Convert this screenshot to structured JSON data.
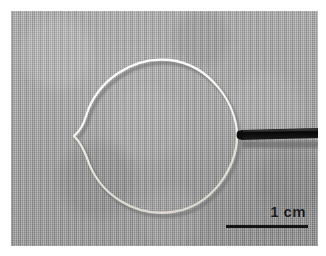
{
  "figure": {
    "kind": "laboratory-photograph",
    "plate_border_color": "#ffffff",
    "background": {
      "material": "woven fabric cloth",
      "color": "#a8a8a8",
      "texture": "fine plain-weave cross hatch"
    }
  },
  "specimen": {
    "wire_loop": {
      "label": "wire-loop",
      "color": "#f2f0ea",
      "shadow_color": "#6e6e6e",
      "description": "near-circular filament loop with a sharp inward cusp on the left side",
      "stroke_width": 2.1
    },
    "rod": {
      "label": "support-rod",
      "color": "#101010",
      "description": "black rod clamping the loop at its right-hand point, running off the right edge"
    },
    "clamp": {
      "label": "clamp-point",
      "color": "#0d0d0d"
    }
  },
  "scale_bar": {
    "label": "1 cm",
    "value": 1,
    "unit": "cm",
    "bar_color": "#141414",
    "text_color": "#1a1a1a",
    "bar_length_px": 82
  }
}
